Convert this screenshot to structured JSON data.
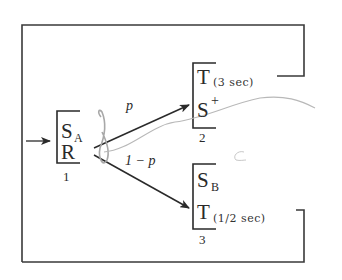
{
  "diagram": {
    "type": "state-transition",
    "states": [
      {
        "id": "1",
        "lines": [
          {
            "main": "S",
            "sub": "A",
            "sup": ""
          },
          {
            "main": "R",
            "sub": "",
            "sup": ""
          }
        ],
        "label": "1"
      },
      {
        "id": "2",
        "lines": [
          {
            "main": "T",
            "sub": "(3 sec)",
            "sup": ""
          },
          {
            "main": "S",
            "sub": "",
            "sup": "+"
          }
        ],
        "label": "2"
      },
      {
        "id": "3",
        "lines": [
          {
            "main": "S",
            "sub": "B",
            "sup": ""
          },
          {
            "main": "T",
            "sub": "(1/2 sec)",
            "sup": ""
          }
        ],
        "label": "3"
      }
    ],
    "transitions": [
      {
        "from": "1",
        "to": "2",
        "label": "p"
      },
      {
        "from": "1",
        "to": "3",
        "label": "1 − p"
      },
      {
        "from": "2",
        "to": "1",
        "label": ""
      },
      {
        "from": "3",
        "to": "1",
        "label": ""
      }
    ],
    "entry_arrow": "→",
    "colors": {
      "ink": "#2a2a2a",
      "pencil": "#a8a8a8"
    }
  }
}
